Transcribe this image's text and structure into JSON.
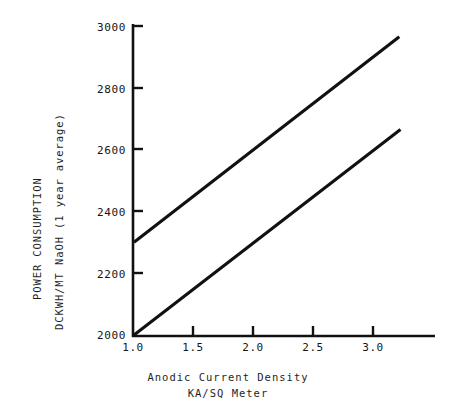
{
  "chart_data": {
    "type": "line",
    "title": "",
    "xlabel": "Anodic Current Density KA/SQ Meter",
    "ylabel": "POWER CONSUMPTION DCKWH/MT NaOH (1 year average)",
    "xlim": [
      1.0,
      3.5
    ],
    "ylim": [
      2000,
      3040
    ],
    "grid": false,
    "legend": "none",
    "x_ticks": [
      "1.0",
      "1.5",
      "2.0",
      "2.5",
      "3.0"
    ],
    "x_tick_values": [
      1.0,
      1.5,
      2.0,
      2.5,
      3.0
    ],
    "y_ticks": [
      "2000",
      "2200",
      "2400",
      "2600",
      "2800",
      "3000"
    ],
    "y_tick_values": [
      2000,
      2200,
      2400,
      2600,
      2800,
      3000
    ],
    "series": [
      {
        "name": "upper-line",
        "x": [
          1.0,
          3.22
        ],
        "values": [
          2300,
          2965
        ],
        "points": [
          [
            1.0,
            2300
          ],
          [
            3.22,
            2965
          ]
        ]
      },
      {
        "name": "lower-line",
        "x": [
          1.0,
          3.23
        ],
        "values": [
          2000,
          2665
        ],
        "points": [
          [
            1.0,
            2000
          ],
          [
            3.23,
            2665
          ]
        ]
      }
    ],
    "annotations": []
  },
  "axes": {
    "y_title_line_1": "POWER CONSUMPTION",
    "y_title_line_2": "DCKWH/MT NaOH (1 year average)",
    "x_caption_line_1": "Anodic Current Density",
    "x_caption_line_2": "KA/SQ Meter"
  },
  "colors": {
    "background": "#ffffff",
    "axis": "#111111",
    "line": "#111111",
    "text": "#1a1a1a"
  }
}
